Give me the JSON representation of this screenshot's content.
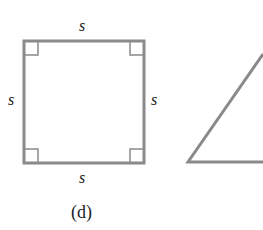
{
  "figure": {
    "caption": "(d)",
    "square": {
      "side_labels": {
        "top": "s",
        "left": "s",
        "right": "s",
        "bottom": "s"
      },
      "right_angle_marks": 4
    },
    "partial_triangle": "cut off at right edge",
    "stroke_color": "#8a8a8a"
  }
}
